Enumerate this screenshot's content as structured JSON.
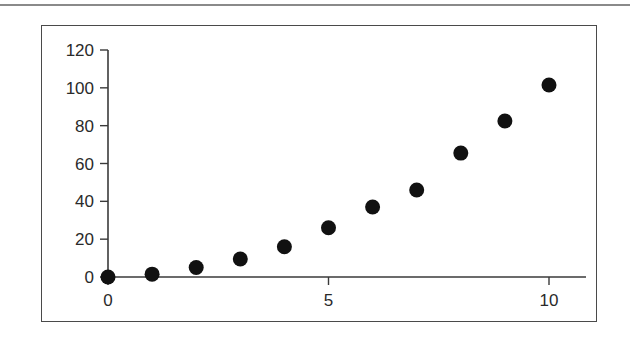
{
  "chart_data": {
    "type": "scatter",
    "title": "",
    "xlabel": "",
    "ylabel": "",
    "x": [
      0,
      1,
      2,
      3,
      4,
      5,
      6,
      7,
      8,
      9,
      10
    ],
    "y": [
      0,
      1.5,
      5,
      9.5,
      16,
      26,
      37,
      46,
      65.5,
      82.5,
      101.5
    ],
    "xlim": [
      0,
      11
    ],
    "ylim": [
      0,
      120
    ],
    "x_ticks": [
      0,
      5,
      10
    ],
    "y_ticks": [
      0,
      20,
      40,
      60,
      80,
      100,
      120
    ],
    "x_tick_labels": [
      "0",
      "5",
      "10"
    ],
    "y_tick_labels": [
      "0",
      "20",
      "40",
      "60",
      "80",
      "100",
      "120"
    ],
    "grid": false,
    "legend": null,
    "marker_color": "#111111",
    "axis_color": "#3a3a3a"
  }
}
